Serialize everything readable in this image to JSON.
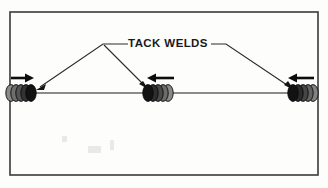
{
  "figure": {
    "background_color": "#fdfdfc",
    "frame": {
      "name": "diagram-border",
      "x": 10,
      "y": 12,
      "width": 308,
      "height": 163,
      "stroke_color": "#3a3a3a"
    }
  },
  "annotation": {
    "label": "TACK WELDS",
    "label_x": 168,
    "label_y": 44,
    "text_color": "#1a1a1a",
    "leaders": [
      {
        "name": "leader-to-left-weld",
        "path": "M 128 44 L 103 44 L 38 89",
        "target": "left-tack-weld"
      },
      {
        "name": "leader-to-middle-weld",
        "path": "M 103 44 L 146 87",
        "target": "middle-tack-weld"
      },
      {
        "name": "leader-to-right-weld",
        "path": "M 210 44 L 226 44 L 292 89",
        "target": "right-tack-weld"
      }
    ]
  },
  "seam": {
    "name": "joint-seam-line",
    "x1": 14,
    "x2": 314,
    "y": 93,
    "stroke_color": "#1c1c1c"
  },
  "welds": [
    {
      "name": "left-tack-weld",
      "center_x": 22,
      "center_y": 93,
      "ripple_count": 5,
      "shade_direction": "light-to-dark-rightward",
      "colors": [
        "#8a8a8a",
        "#6e6e6e",
        "#545454",
        "#333333",
        "#121212"
      ]
    },
    {
      "name": "middle-tack-weld",
      "center_x": 158,
      "center_y": 93,
      "ripple_count": 5,
      "shade_direction": "dark-to-light-rightward",
      "colors": [
        "#121212",
        "#2e2e2e",
        "#4a4a4a",
        "#6b6b6b",
        "#8a8a8a"
      ]
    },
    {
      "name": "right-tack-weld",
      "center_x": 303,
      "center_y": 93,
      "ripple_count": 5,
      "shade_direction": "dark-to-light-rightward",
      "colors": [
        "#121212",
        "#2b2b2b",
        "#464646",
        "#636363",
        "#828282"
      ]
    }
  ],
  "travel_arrows": [
    {
      "name": "travel-arrow-left",
      "direction": "right",
      "y": 78,
      "start_x": 11,
      "end_x": 34,
      "color": "#0d0d0d"
    },
    {
      "name": "travel-arrow-middle",
      "direction": "left",
      "y": 78,
      "start_x": 174,
      "end_x": 147,
      "color": "#0d0d0d"
    },
    {
      "name": "travel-arrow-right",
      "direction": "left",
      "y": 78,
      "start_x": 314,
      "end_x": 288,
      "color": "#0d0d0d"
    }
  ]
}
